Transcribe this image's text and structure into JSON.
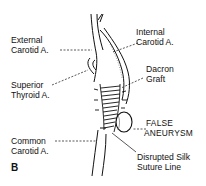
{
  "figure": {
    "panel_letter": "B",
    "labels": {
      "external_carotid": [
        "External",
        "Carotid A."
      ],
      "internal_carotid": [
        "Internal",
        "Carotid A."
      ],
      "superior_thyroid": [
        "Superior",
        "Thyroid A."
      ],
      "dacron_graft": [
        "Dacron",
        "Graft"
      ],
      "false_aneurysm": [
        "FALSE",
        "ANEURYSM"
      ],
      "common_carotid": [
        "Common",
        "Carotid A."
      ],
      "disrupted_suture": [
        "Disrupted Silk",
        "Suture Line"
      ]
    },
    "colors": {
      "ink": "#111111",
      "background": "#ffffff"
    }
  }
}
